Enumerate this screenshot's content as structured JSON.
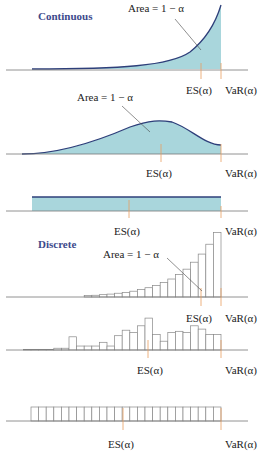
{
  "colors": {
    "fill": "#a9d6dc",
    "curve": "#2e3f7a",
    "axis": "#777777",
    "marker": "#e8a060",
    "heading": "#3d4a8c"
  },
  "headings": {
    "continuous": "Continuous",
    "discrete": "Discrete"
  },
  "labels": {
    "area": "Area = 1 − α",
    "es": "ES(α)",
    "var": "VaR(α)"
  },
  "panels": [
    {
      "id": "continuous-exponential",
      "type": "continuous",
      "shape": "increasing"
    },
    {
      "id": "continuous-bell",
      "type": "continuous",
      "shape": "hump"
    },
    {
      "id": "continuous-uniform",
      "type": "continuous",
      "shape": "uniform"
    },
    {
      "id": "discrete-increasing",
      "type": "discrete",
      "bars": [
        0.5,
        0.6,
        0.8,
        1,
        1.3,
        1.6,
        2,
        2.6,
        3.2,
        4,
        5,
        6.2,
        7.8,
        9.6,
        12,
        14.8,
        18.2,
        22.2
      ]
    },
    {
      "id": "discrete-irregular",
      "type": "discrete",
      "bars": [
        0.3,
        0.3,
        0.3,
        0.3,
        0.8,
        0.8,
        6,
        1.8,
        1.8,
        1.8,
        3.5,
        1.8,
        6.5,
        9,
        8,
        11,
        14.5,
        7,
        4,
        8,
        8.5,
        8,
        11,
        9.5,
        7,
        7
      ]
    },
    {
      "id": "discrete-uniform",
      "type": "discrete",
      "bars": [
        1,
        1,
        1,
        1,
        1,
        1,
        1,
        1,
        1,
        1,
        1,
        1,
        1,
        1,
        1,
        1,
        1,
        1,
        1,
        1,
        1,
        1,
        1,
        1,
        1
      ]
    }
  ]
}
